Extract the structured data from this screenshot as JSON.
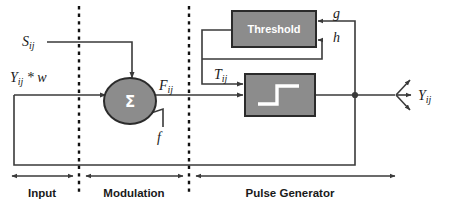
{
  "diagram": {
    "colors": {
      "block_fill": "#8c8c8c",
      "block_stroke": "#2b2b2b",
      "block_text": "#ffffff",
      "wire": "#3a3a3a",
      "divider": "#111111",
      "background": "#ffffff"
    },
    "blocks": [
      {
        "id": "threshold",
        "label": "Threshold",
        "shape": "rect"
      },
      {
        "id": "step",
        "label": "",
        "shape": "rect",
        "icon": "step-function-icon"
      },
      {
        "id": "summation",
        "label": "Σ",
        "shape": "circle"
      }
    ],
    "signals": {
      "stimulus": "S",
      "stimulus_sub": "ij",
      "feedback_input": "Y",
      "feedback_input_sub": "ij",
      "feedback_input_tail": " * w",
      "modulated": "F",
      "modulated_sub": "ij",
      "linking": "f",
      "threshold_out": "T",
      "threshold_out_sub": "ij",
      "decay_g": "g",
      "decay_h": "h",
      "output": "Y",
      "output_sub": "ij"
    },
    "sections": [
      {
        "id": "input",
        "label": "Input"
      },
      {
        "id": "modulation",
        "label": "Modulation"
      },
      {
        "id": "pulse-generator",
        "label": "Pulse Generator"
      }
    ]
  }
}
